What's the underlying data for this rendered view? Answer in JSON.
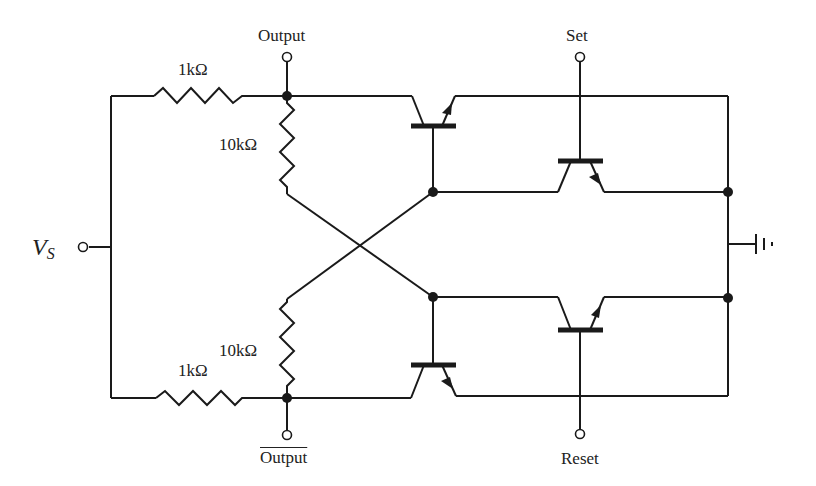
{
  "diagram": {
    "type": "circuit-schematic",
    "labels": {
      "supply": "V",
      "supply_sub": "S",
      "output_top": "Output",
      "output_bottom": "Output",
      "set": "Set",
      "reset": "Reset",
      "r_top_series": "1kΩ",
      "r_bottom_series": "1kΩ",
      "r_top_cross": "10kΩ",
      "r_bottom_cross": "10kΩ"
    },
    "components": [
      {
        "id": "R1",
        "type": "resistor",
        "value": "1kΩ",
        "position": "top-left series"
      },
      {
        "id": "R2",
        "type": "resistor",
        "value": "1kΩ",
        "position": "bottom-left series"
      },
      {
        "id": "R3",
        "type": "resistor",
        "value": "10kΩ",
        "position": "top cross-coupling"
      },
      {
        "id": "R4",
        "type": "resistor",
        "value": "10kΩ",
        "position": "bottom cross-coupling"
      },
      {
        "id": "Q1",
        "type": "transistor",
        "position": "top-left"
      },
      {
        "id": "Q2",
        "type": "transistor",
        "position": "bottom-left"
      },
      {
        "id": "Q3",
        "type": "transistor",
        "position": "top-right",
        "input": "Set"
      },
      {
        "id": "Q4",
        "type": "transistor",
        "position": "bottom-right",
        "input": "Reset"
      },
      {
        "id": "GND",
        "type": "ground",
        "position": "right"
      }
    ]
  }
}
